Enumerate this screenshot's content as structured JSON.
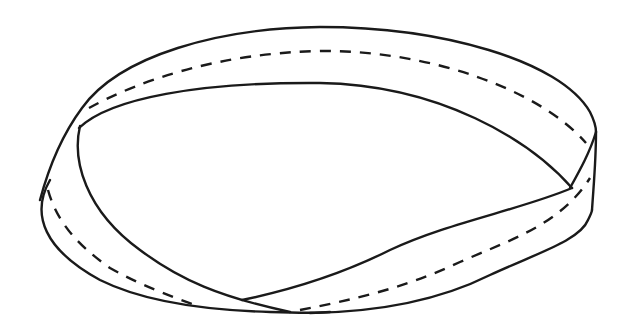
{
  "figure": {
    "stroke_color": "#1a1a1a",
    "background_color": "#ffffff",
    "elements": [
      {
        "name": "outer-top-edge",
        "style": "solid"
      },
      {
        "name": "inner-top-edge",
        "style": "solid"
      },
      {
        "name": "top-centerline",
        "style": "dashed"
      },
      {
        "name": "right-fold-edge",
        "style": "solid"
      },
      {
        "name": "left-outer-edge",
        "style": "solid"
      },
      {
        "name": "left-inner-edge",
        "style": "solid"
      },
      {
        "name": "front-upper-edge",
        "style": "solid"
      },
      {
        "name": "front-lower-edge",
        "style": "solid"
      },
      {
        "name": "left-centerline",
        "style": "dashed"
      },
      {
        "name": "front-centerline",
        "style": "dashed"
      }
    ]
  }
}
